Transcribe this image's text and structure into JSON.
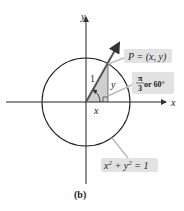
{
  "diagram": {
    "axes": {
      "x_label": "x",
      "y_label": "y"
    },
    "circle_equation": {
      "base_x": "x",
      "exp": "2",
      "plus": " + ",
      "base_y": "y",
      "eq": " = 1"
    },
    "point_label": "P = (x, y)",
    "hypotenuse_label": "1",
    "leg_x_label": "x",
    "leg_y_label": "y",
    "angle": {
      "numerator": "π",
      "denominator": "3",
      "text": " or 60°"
    },
    "caption": "(b)",
    "colors": {
      "triangle_fill": "#c9c9c9",
      "callout_fill": "#e2e2e2",
      "line": "#222222",
      "arrow": "#555555"
    }
  }
}
